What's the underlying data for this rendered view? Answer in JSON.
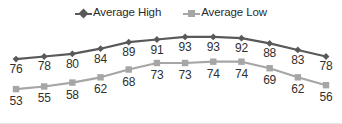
{
  "legend": {
    "position": "top",
    "entries": [
      {
        "label": "Average High",
        "marker": "diamond-marker-icon",
        "color": "#595959"
      },
      {
        "label": "Average Low",
        "marker": "square-marker-icon",
        "color": "#a6a6a6"
      }
    ]
  },
  "colors": {
    "high": "#595959",
    "low": "#a6a6a6",
    "label_text": "#2f2f2f",
    "background": "#ffffff"
  },
  "chart_data": {
    "type": "line",
    "title": "",
    "xlabel": "",
    "ylabel": "",
    "grid": false,
    "legend_position": "top",
    "axes_visible": false,
    "data_labels": true,
    "categories": [
      "1",
      "2",
      "3",
      "4",
      "5",
      "6",
      "7",
      "8",
      "9",
      "10",
      "11",
      "12"
    ],
    "ylim": [
      50,
      96
    ],
    "series": [
      {
        "name": "Average High",
        "color": "#595959",
        "marker": "diamond",
        "values": [
          76,
          78,
          80,
          84,
          89,
          91,
          93,
          93,
          92,
          88,
          83,
          78
        ]
      },
      {
        "name": "Average Low",
        "color": "#a6a6a6",
        "marker": "square",
        "values": [
          53,
          55,
          58,
          62,
          68,
          73,
          73,
          74,
          74,
          69,
          62,
          56
        ]
      }
    ]
  }
}
